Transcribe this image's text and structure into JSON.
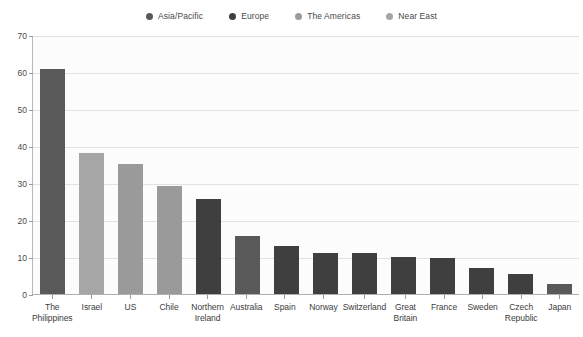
{
  "chart_data": {
    "type": "bar",
    "title": "",
    "subtitle": "",
    "xlabel": "",
    "ylabel": "",
    "ylim": [
      0,
      70
    ],
    "yticks": [
      0,
      10,
      20,
      30,
      40,
      50,
      60,
      70
    ],
    "grid": true,
    "legend_position": "top-center",
    "categories": [
      "The\nPhilippines",
      "Israel",
      "US",
      "Chile",
      "Northern\nIreland",
      "Australia",
      "Spain",
      "Norway",
      "Switzerland",
      "Great\nBritain",
      "France",
      "Sweden",
      "Czech\nRepublic",
      "Japan"
    ],
    "values": [
      61,
      38.5,
      35.5,
      29.5,
      26,
      16,
      13.3,
      11.3,
      11.3,
      10.2,
      10,
      7.2,
      5.7,
      3
    ],
    "groups": [
      "Asia/Pacific",
      "Near East",
      "The Americas",
      "The Americas",
      "Europe",
      "Asia/Pacific",
      "Europe",
      "Europe",
      "Europe",
      "Europe",
      "Europe",
      "Europe",
      "Europe",
      "Asia/Pacific"
    ]
  },
  "legend": {
    "items": [
      {
        "label": "Asia/Pacific",
        "color": "#595959"
      },
      {
        "label": "Europe",
        "color": "#3f3f3f"
      },
      {
        "label": "The Americas",
        "color": "#9a9a9a"
      },
      {
        "label": "Near East",
        "color": "#a6a6a6"
      }
    ]
  },
  "colors": {
    "Asia/Pacific": "#595959",
    "Europe": "#3f3f3f",
    "The Americas": "#9a9a9a",
    "Near East": "#a6a6a6",
    "plot_background": "#fcfcfc",
    "gridline": "#e2e2e2",
    "axis": "#b0b0b0",
    "text": "#3c3c3c"
  }
}
